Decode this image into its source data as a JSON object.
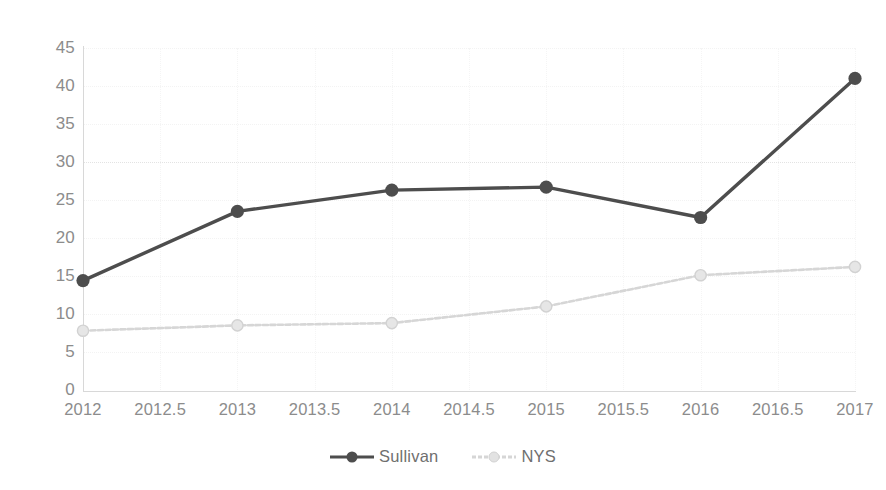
{
  "chart_data": {
    "type": "line",
    "title": "",
    "subtitle": "",
    "xlabel": "",
    "ylabel": "",
    "x": [
      2012,
      2013,
      2014,
      2015,
      2016,
      2017
    ],
    "xlim": [
      2012,
      2017
    ],
    "ylim": [
      0,
      45
    ],
    "grid": true,
    "legend_position": "bottom",
    "x_tick_labels": [
      "2012",
      "2012.5",
      "2013",
      "2013.5",
      "2014",
      "2014.5",
      "2015",
      "2015.5",
      "2016",
      "2016.5",
      "2017"
    ],
    "x_tick_values": [
      2012,
      2012.5,
      2013,
      2013.5,
      2014,
      2014.5,
      2015,
      2015.5,
      2016,
      2016.5,
      2017
    ],
    "y_tick_labels": [
      "45",
      "40",
      "35",
      "30",
      "25",
      "20",
      "15",
      "10",
      "5",
      "0"
    ],
    "y_tick_values": [
      45,
      40,
      35,
      30,
      25,
      20,
      15,
      10,
      5,
      0
    ],
    "series": [
      {
        "name": "Sullivan",
        "color": "#4d4d4d",
        "marker": "circle",
        "values": [
          14.4,
          23.5,
          26.3,
          26.7,
          22.7,
          41.0
        ]
      },
      {
        "name": "NYS",
        "color": "#d6d6d6",
        "marker": "circle",
        "values": [
          7.8,
          8.5,
          8.8,
          11.0,
          15.1,
          16.2
        ]
      }
    ]
  },
  "legend": {
    "items": [
      {
        "label": "Sullivan",
        "color": "#4d4d4d"
      },
      {
        "label": "NYS",
        "color": "#d6d6d6"
      }
    ]
  },
  "colors": {
    "background": "#ffffff",
    "axis": "#d8d8d8",
    "tick_text": "#8c8c8c",
    "grid": "#eeeeee",
    "series_sullivan": "#4d4d4d",
    "series_nys": "#d6d6d6"
  }
}
